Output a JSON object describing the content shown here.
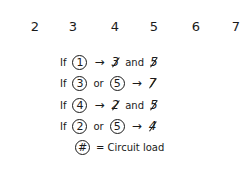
{
  "numbers": [
    "2",
    "3",
    "4",
    "5",
    "6",
    "7"
  ],
  "rules": [
    {
      "if": "If",
      "conds": [
        "1"
      ],
      "joiner": "",
      "arrow": "→",
      "results": [
        "3",
        "5"
      ],
      "result_joiner": "and"
    },
    {
      "if": "If",
      "conds": [
        "3",
        "5"
      ],
      "joiner": "or",
      "arrow": "→",
      "results": [
        "7"
      ],
      "result_joiner": ""
    },
    {
      "if": "If",
      "conds": [
        "4"
      ],
      "joiner": "",
      "arrow": "→",
      "results": [
        "2",
        "5"
      ],
      "result_joiner": "and"
    },
    {
      "if": "If",
      "conds": [
        "2",
        "5"
      ],
      "joiner": "or",
      "arrow": "→",
      "results": [
        "4"
      ],
      "result_joiner": ""
    }
  ],
  "legend": {
    "symbol": "#",
    "text": "= Circuit load"
  }
}
